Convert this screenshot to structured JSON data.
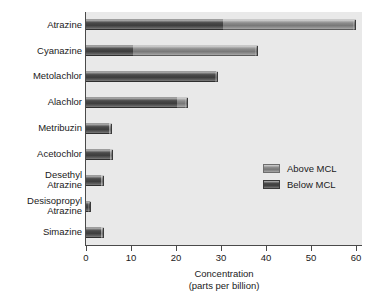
{
  "chart_data": {
    "type": "bar",
    "orientation": "horizontal",
    "stacked": true,
    "title": "",
    "xlabel": "Concentration\n(parts per billion)",
    "xlabel_line1": "Concentration",
    "xlabel_line2": "(parts per billion)",
    "ylabel": "",
    "xlim": [
      0,
      60
    ],
    "xticks": [
      0,
      10,
      20,
      30,
      40,
      50,
      60
    ],
    "xticklabels": [
      "0",
      "10",
      "20",
      "30",
      "40",
      "50",
      "60"
    ],
    "grid": false,
    "legend_position": "center right (inset)",
    "categories": [
      "Atrazine",
      "Cyanazine",
      "Metolachlor",
      "Alachlor",
      "Metribuzin",
      "Acetochlor",
      "Desethyl\nAtrazine",
      "Desisopropyl\nAtrazine",
      "Simazine"
    ],
    "series": [
      {
        "name": "Below MCL",
        "color": "#444444",
        "values": [
          30.4,
          10.5,
          28.8,
          20.2,
          5.2,
          5.4,
          3.4,
          0.9,
          3.4
        ]
      },
      {
        "name": "Above MCL",
        "color": "#8d8d8d",
        "values": [
          29.6,
          27.7,
          0.5,
          2.5,
          0.6,
          0.6,
          0.5,
          0.2,
          0.5
        ]
      }
    ],
    "totals": [
      60.0,
      38.2,
      29.3,
      22.7,
      5.8,
      6.0,
      3.9,
      1.1,
      3.9
    ],
    "colors": {
      "panel_background": "#e9e9e9",
      "figure_background": "#ffffff",
      "axis": "#4a4a4a",
      "text": "#1a1a1a"
    }
  },
  "legend": {
    "entries": [
      {
        "label": "Above MCL",
        "swatch": "above"
      },
      {
        "label": "Below MCL",
        "swatch": "below"
      }
    ]
  }
}
